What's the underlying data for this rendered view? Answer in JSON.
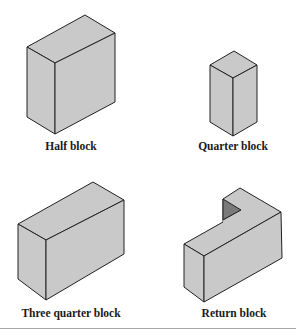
{
  "figure": {
    "blocks": [
      {
        "id": "half",
        "label": "Half block"
      },
      {
        "id": "quarter",
        "label": "Quarter block"
      },
      {
        "id": "three-quarter",
        "label": "Three quarter block"
      },
      {
        "id": "return",
        "label": "Return block"
      }
    ],
    "colors": {
      "face": "#c9c9c9",
      "shadow": "#7a7a7a",
      "outline": "#222222",
      "separator": "#aaaaaa"
    }
  }
}
